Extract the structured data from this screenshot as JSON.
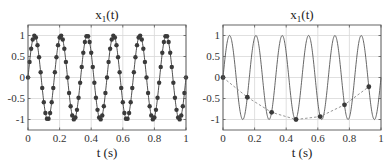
{
  "chart_data": [
    {
      "type": "line",
      "title": "x1(t)",
      "title_main": "x",
      "title_sub": "1",
      "title_tail": "(t)",
      "xlabel": "t  (s)",
      "ylabel": "",
      "xlim": [
        0,
        1
      ],
      "ylim": [
        -1.25,
        1.25
      ],
      "xticks": [
        0,
        0.2,
        0.4,
        0.6,
        0.8,
        1
      ],
      "xtick_labels": [
        "0",
        "0.2",
        "0.4",
        "0.6",
        "0.8",
        "1"
      ],
      "yticks": [
        1,
        0.5,
        0,
        -0.5,
        -1
      ],
      "ytick_labels": [
        "1",
        "0.5",
        "0",
        "-0.5",
        "-1"
      ],
      "grid": true,
      "series": [
        {
          "name": "x1(t) = sin(2π·6·t) densely sampled",
          "style": "solid line with filled circle markers",
          "frequency_hz": 6,
          "sample_rate_hz": 100,
          "color": "#3a3a3a"
        }
      ]
    },
    {
      "type": "line",
      "title": "x1(t)",
      "title_main": "x",
      "title_sub": "1",
      "title_tail": "(t)",
      "xlabel": "t  (s)",
      "ylabel": "",
      "xlim": [
        0,
        1
      ],
      "ylim": [
        -1.25,
        1.25
      ],
      "xticks": [
        0,
        0.2,
        0.4,
        0.6,
        0.8,
        1
      ],
      "xtick_labels": [
        "0",
        "0.2",
        "0.4",
        "0.6",
        "0.8",
        "1"
      ],
      "yticks": [
        1,
        0.5,
        0,
        -0.5,
        -1
      ],
      "ytick_labels": [
        "1",
        "0.5",
        "0",
        "-0.5",
        "-1"
      ],
      "grid": true,
      "series": [
        {
          "name": "x1(t) continuous",
          "style": "solid line",
          "frequency_hz": 6,
          "color": "#555555"
        },
        {
          "name": "undersampled x1",
          "style": "dashed line with filled circle markers",
          "x": [
            0,
            0.154,
            0.308,
            0.462,
            0.615,
            0.769,
            0.923
          ],
          "y": [
            0,
            -0.47,
            -0.83,
            -1.0,
            -0.93,
            -0.65,
            -0.22
          ],
          "color": "#3a3a3a"
        }
      ]
    }
  ]
}
